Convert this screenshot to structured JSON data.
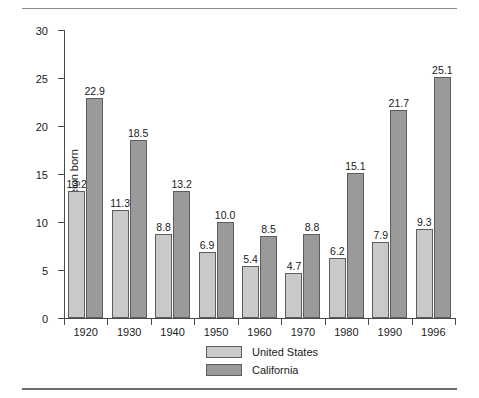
{
  "chart_data": {
    "type": "bar",
    "title": "",
    "xlabel": "",
    "ylabel": "Percent foreign born",
    "categories": [
      "1920",
      "1930",
      "1940",
      "1950",
      "1960",
      "1970",
      "1980",
      "1990",
      "1996"
    ],
    "series": [
      {
        "name": "United States",
        "color": "#c9c9c9",
        "values": [
          13.2,
          11.3,
          8.8,
          6.9,
          5.4,
          4.7,
          6.2,
          7.9,
          9.3
        ]
      },
      {
        "name": "California",
        "color": "#9a9a9a",
        "values": [
          22.9,
          18.5,
          13.2,
          10.0,
          8.5,
          8.8,
          15.1,
          21.7,
          25.1
        ]
      }
    ],
    "ylim": [
      0,
      30
    ],
    "yticks": [
      0,
      5,
      10,
      15,
      20,
      25,
      30
    ],
    "ytick_labels": [
      "0",
      "5",
      "10",
      "15",
      "20",
      "25",
      "30"
    ],
    "value_labels": {
      "United States": [
        "13.2",
        "11.3",
        "8.8",
        "6.9",
        "5.4",
        "4.7",
        "6.2",
        "7.9",
        "9.3"
      ],
      "California": [
        "22.9",
        "18.5",
        "13.2",
        "10.0",
        "8.5",
        "8.8",
        "15.1",
        "21.7",
        "25.1"
      ]
    },
    "grid": false,
    "legend_position": "bottom-center",
    "legend": [
      "United States",
      "California"
    ]
  }
}
